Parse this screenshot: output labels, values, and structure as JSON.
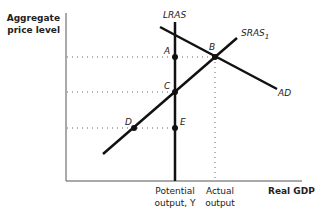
{
  "diagram": {
    "type": "AS-AD model",
    "y_axis_label": [
      "Aggregate",
      "price level"
    ],
    "x_axis_label": "Real GDP",
    "x_ticks": [
      {
        "lines": [
          "Potential",
          "output, Y"
        ],
        "x": 175
      },
      {
        "lines": [
          "Actual",
          "output"
        ],
        "x": 215
      }
    ],
    "curves": [
      {
        "name": "LRAS",
        "label": "LRAS",
        "kind": "vertical"
      },
      {
        "name": "SRAS1",
        "label": "SRAS",
        "subscript": "1",
        "kind": "upward"
      },
      {
        "name": "AD",
        "label": "AD",
        "kind": "downward"
      }
    ],
    "points": [
      {
        "label": "A",
        "x": 175,
        "y": 57
      },
      {
        "label": "B",
        "x": 215,
        "y": 57
      },
      {
        "label": "C",
        "x": 175,
        "y": 92
      },
      {
        "label": "D",
        "x": 134,
        "y": 128
      },
      {
        "label": "E",
        "x": 175,
        "y": 128
      }
    ],
    "colors": {
      "line": "#111111",
      "text": "#222222",
      "dotted": "#555555"
    }
  }
}
